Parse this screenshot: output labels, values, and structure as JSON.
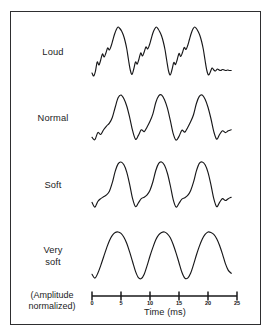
{
  "figure": {
    "rows": [
      {
        "id": "loud",
        "label": "Loud"
      },
      {
        "id": "normal",
        "label": "Normal"
      },
      {
        "id": "soft",
        "label": "Soft"
      },
      {
        "id": "very-soft",
        "label": "Very\nsoft"
      }
    ],
    "amplitude_note": "(Amplitude\nnormalized)",
    "axis_title": "Time (ms)",
    "tick_labels": [
      "0",
      "5",
      "10",
      "15",
      "20",
      "25"
    ],
    "stroke_color": "#18181a",
    "border_color": "#2e2e30",
    "background_color": "#ffffff"
  },
  "chart_data": {
    "type": "line",
    "title": "",
    "xlabel": "Time (ms)",
    "ylabel": "(Amplitude normalized)",
    "xlim": [
      0,
      25
    ],
    "grid": false,
    "legend": "none",
    "x_ticks": [
      0,
      5,
      10,
      15,
      20,
      25
    ],
    "x_tick_labels": [
      "0",
      "5",
      "10",
      "15",
      "20",
      "25"
    ],
    "period_ms": 7.5,
    "cycles": 3,
    "series": [
      {
        "name": "Loud",
        "description": "Complex periodic waveform with strong high-frequency ripple riding on the fundamental; sharp deep valleys.",
        "x": [
          0.0,
          0.3,
          0.6,
          0.9,
          1.2,
          1.5,
          1.8,
          2.1,
          2.4,
          2.7,
          3.0,
          3.3,
          3.6,
          3.9,
          4.2,
          4.5,
          4.8,
          5.1,
          5.4,
          5.7,
          6.0,
          6.3,
          6.6,
          6.9,
          7.2,
          7.5,
          7.8,
          8.1,
          8.4,
          8.7,
          9.0,
          9.3,
          9.6,
          9.9,
          10.2,
          10.5,
          10.8,
          11.1,
          11.4,
          11.7,
          12.0,
          12.3,
          12.6,
          12.9,
          13.2,
          13.5,
          13.8,
          14.1,
          14.4,
          14.7,
          15.0,
          15.3,
          15.6,
          15.9,
          16.2,
          16.5,
          16.8,
          17.1,
          17.4,
          17.7,
          18.0,
          18.3,
          18.6,
          18.9,
          19.2,
          19.5,
          19.8,
          20.1,
          20.4,
          20.7,
          21.0,
          21.3,
          21.6,
          21.9,
          22.2,
          22.5,
          22.8,
          23.1,
          23.4,
          23.7,
          24.0
        ],
        "y": [
          0.08,
          0.02,
          0.12,
          0.3,
          0.24,
          0.34,
          0.46,
          0.4,
          0.48,
          0.58,
          0.54,
          0.62,
          0.74,
          0.86,
          0.95,
          1.0,
          0.97,
          0.92,
          0.84,
          0.72,
          0.56,
          0.34,
          0.14,
          0.05,
          0.16,
          0.3,
          0.26,
          0.36,
          0.48,
          0.42,
          0.5,
          0.6,
          0.56,
          0.64,
          0.76,
          0.88,
          0.96,
          1.0,
          0.96,
          0.9,
          0.82,
          0.7,
          0.54,
          0.32,
          0.12,
          0.04,
          0.15,
          0.29,
          0.25,
          0.35,
          0.47,
          0.41,
          0.49,
          0.59,
          0.55,
          0.63,
          0.75,
          0.87,
          0.96,
          1.0,
          0.97,
          0.91,
          0.83,
          0.71,
          0.55,
          0.33,
          0.13,
          0.04,
          0.1,
          0.18,
          0.14,
          0.12,
          0.16,
          0.14,
          0.13,
          0.15,
          0.14,
          0.13,
          0.14,
          0.13,
          0.13
        ]
      },
      {
        "name": "Normal",
        "description": "Periodic waveform, moderately complex; a small shoulder bump on each rising edge.",
        "x": [
          0.0,
          0.5,
          1.0,
          1.5,
          2.0,
          2.5,
          3.0,
          3.5,
          4.0,
          4.5,
          5.0,
          5.5,
          6.0,
          6.5,
          7.0,
          7.5,
          8.0,
          8.5,
          9.0,
          9.5,
          10.0,
          10.5,
          11.0,
          11.5,
          12.0,
          12.5,
          13.0,
          13.5,
          14.0,
          14.5,
          15.0,
          15.5,
          16.0,
          16.5,
          17.0,
          17.5,
          18.0,
          18.5,
          19.0,
          19.5,
          20.0,
          20.5,
          21.0,
          21.5,
          22.0,
          22.5,
          23.0,
          23.5,
          24.0
        ],
        "y": [
          0.1,
          0.05,
          0.2,
          0.16,
          0.26,
          0.34,
          0.4,
          0.52,
          0.74,
          0.94,
          1.0,
          0.92,
          0.76,
          0.52,
          0.24,
          0.06,
          0.14,
          0.26,
          0.22,
          0.32,
          0.44,
          0.6,
          0.84,
          0.98,
          1.0,
          0.9,
          0.72,
          0.46,
          0.18,
          0.04,
          0.12,
          0.25,
          0.21,
          0.31,
          0.43,
          0.58,
          0.82,
          0.97,
          1.0,
          0.91,
          0.74,
          0.5,
          0.22,
          0.06,
          0.16,
          0.24,
          0.2,
          0.24,
          0.26
        ]
      },
      {
        "name": "Soft",
        "description": "Near-sinusoidal periodic waveform with slight shoulders on the rising edge.",
        "x": [
          0.0,
          0.5,
          1.0,
          1.5,
          2.0,
          2.5,
          3.0,
          3.5,
          4.0,
          4.5,
          5.0,
          5.5,
          6.0,
          6.5,
          7.0,
          7.5,
          8.0,
          8.5,
          9.0,
          9.5,
          10.0,
          10.5,
          11.0,
          11.5,
          12.0,
          12.5,
          13.0,
          13.5,
          14.0,
          14.5,
          15.0,
          15.5,
          16.0,
          16.5,
          17.0,
          17.5,
          18.0,
          18.5,
          19.0,
          19.5,
          20.0,
          20.5,
          21.0,
          21.5,
          22.0,
          22.5,
          23.0,
          23.5,
          24.0
        ],
        "y": [
          0.14,
          0.04,
          0.16,
          0.22,
          0.26,
          0.3,
          0.38,
          0.56,
          0.8,
          0.96,
          1.0,
          0.94,
          0.78,
          0.52,
          0.22,
          0.05,
          0.13,
          0.22,
          0.25,
          0.3,
          0.4,
          0.58,
          0.82,
          0.97,
          1.0,
          0.93,
          0.76,
          0.5,
          0.2,
          0.04,
          0.12,
          0.21,
          0.24,
          0.29,
          0.39,
          0.57,
          0.81,
          0.97,
          1.0,
          0.94,
          0.78,
          0.52,
          0.22,
          0.05,
          0.14,
          0.22,
          0.18,
          0.22,
          0.25
        ]
      },
      {
        "name": "Very soft",
        "description": "Essentially a pure sinusoid: smooth rounded peaks, rounded troughs.",
        "x": [
          0.0,
          0.5,
          1.0,
          1.5,
          2.0,
          2.5,
          3.0,
          3.5,
          4.0,
          4.5,
          5.0,
          5.5,
          6.0,
          6.5,
          7.0,
          7.5,
          8.0,
          8.5,
          9.0,
          9.5,
          10.0,
          10.5,
          11.0,
          11.5,
          12.0,
          12.5,
          13.0,
          13.5,
          14.0,
          14.5,
          15.0,
          15.5,
          16.0,
          16.5,
          17.0,
          17.5,
          18.0,
          18.5,
          19.0,
          19.5,
          20.0,
          20.5,
          21.0,
          21.5,
          22.0,
          22.5,
          23.0,
          23.5,
          24.0
        ],
        "y": [
          0.12,
          0.04,
          0.14,
          0.3,
          0.48,
          0.66,
          0.82,
          0.93,
          0.99,
          1.0,
          0.97,
          0.89,
          0.76,
          0.58,
          0.38,
          0.18,
          0.05,
          0.03,
          0.12,
          0.3,
          0.5,
          0.68,
          0.84,
          0.94,
          0.99,
          1.0,
          0.96,
          0.88,
          0.74,
          0.56,
          0.36,
          0.16,
          0.04,
          0.04,
          0.14,
          0.32,
          0.52,
          0.7,
          0.85,
          0.95,
          1.0,
          0.99,
          0.95,
          0.86,
          0.72,
          0.54,
          0.34,
          0.2,
          0.14
        ]
      }
    ]
  }
}
